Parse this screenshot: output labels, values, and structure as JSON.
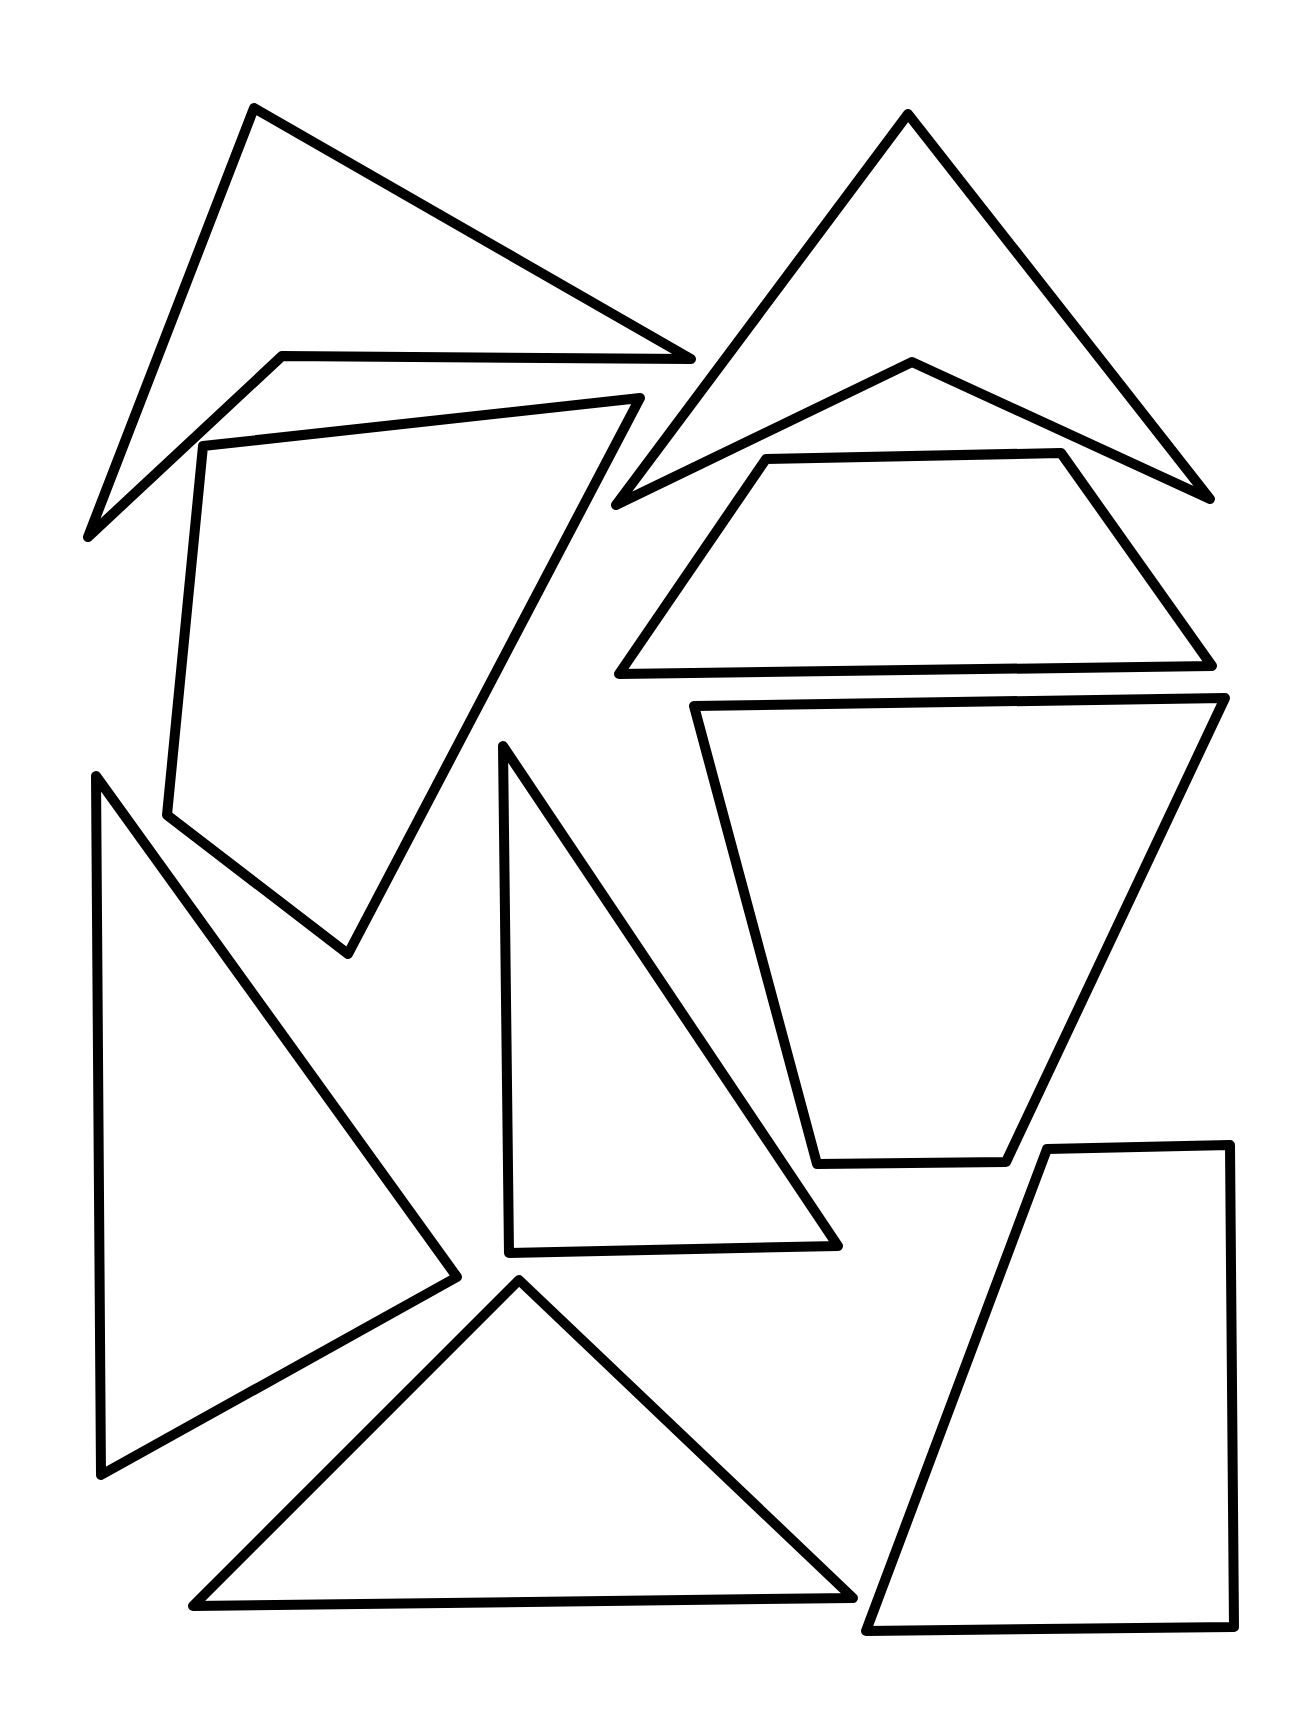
{
  "page": {
    "background": "#ffffff",
    "stroke_color": "#000000",
    "stroke_width": 10
  },
  "shapes": [
    {
      "name": "concave-quadrilateral-top-left",
      "points": "254,108 691,359 282,356 88,537"
    },
    {
      "name": "quadrilateral-left",
      "points": "203,446 640,398 348,954 167,815"
    },
    {
      "name": "arrowhead-top-right",
      "points": "908,114 1210,499 912,362 616,505"
    },
    {
      "name": "trapezoid-right-upper",
      "points": "766,459 1061,453 1212,666 619,674"
    },
    {
      "name": "trapezoid-right-middle",
      "points": "694,706 1225,698 1006,1162 817,1164"
    },
    {
      "name": "triangle-left-large",
      "points": "96,776 457,1277 101,1475"
    },
    {
      "name": "triangle-center-right-angle",
      "points": "503,746 838,1246 509,1253"
    },
    {
      "name": "triangle-bottom",
      "points": "519,1280 853,1598 193,1606"
    },
    {
      "name": "trapezoid-bottom-right",
      "points": "1047,1149 1230,1145 1234,1627 866,1631"
    }
  ]
}
